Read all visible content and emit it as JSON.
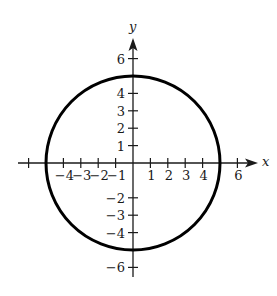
{
  "chart_data": {
    "type": "line",
    "title": "",
    "xlabel": "x",
    "ylabel": "y",
    "xlim": [
      -6.5,
      7
    ],
    "ylim": [
      -6.5,
      7
    ],
    "grid": false,
    "legend": null,
    "x_ticks": [
      -6,
      -4,
      -3,
      -2,
      -1,
      1,
      2,
      3,
      4,
      6
    ],
    "x_tick_labels": [
      "-4",
      "-3",
      "-2",
      "-1",
      "1",
      "2",
      "3",
      "4",
      "6"
    ],
    "y_ticks": [
      -6,
      -4,
      -3,
      -2,
      1,
      2,
      3,
      4,
      6
    ],
    "y_tick_labels": [
      "6",
      "4",
      "3",
      "2",
      "1",
      "-2",
      "-3",
      "-4",
      "-6"
    ],
    "series": [
      {
        "name": "circle",
        "equation": "x^2 + y^2 = 25",
        "center": [
          0,
          0
        ],
        "radius": 5,
        "color": "#000000"
      }
    ]
  },
  "labels": {
    "x_axis": "x",
    "y_axis": "y",
    "x_neg": [
      {
        "v": -4,
        "t": "−4"
      },
      {
        "v": -3,
        "t": "−3"
      },
      {
        "v": -2,
        "t": "−2"
      },
      {
        "v": -1,
        "t": "−1"
      }
    ],
    "x_pos": [
      {
        "v": 1,
        "t": "1"
      },
      {
        "v": 2,
        "t": "2"
      },
      {
        "v": 3,
        "t": "3"
      },
      {
        "v": 4,
        "t": "4"
      },
      {
        "v": 6,
        "t": "6"
      }
    ],
    "y_pos": [
      {
        "v": 6,
        "t": "6"
      },
      {
        "v": 4,
        "t": "4"
      },
      {
        "v": 3,
        "t": "3"
      },
      {
        "v": 2,
        "t": "2"
      },
      {
        "v": 1,
        "t": "1"
      }
    ],
    "y_neg": [
      {
        "v": -2,
        "t": "−2"
      },
      {
        "v": -3,
        "t": "−3"
      },
      {
        "v": -4,
        "t": "−4"
      },
      {
        "v": -6,
        "t": "−6"
      }
    ]
  },
  "colors": {
    "axis": "#1a1a1a",
    "curve": "#000000",
    "background": "#ffffff"
  }
}
